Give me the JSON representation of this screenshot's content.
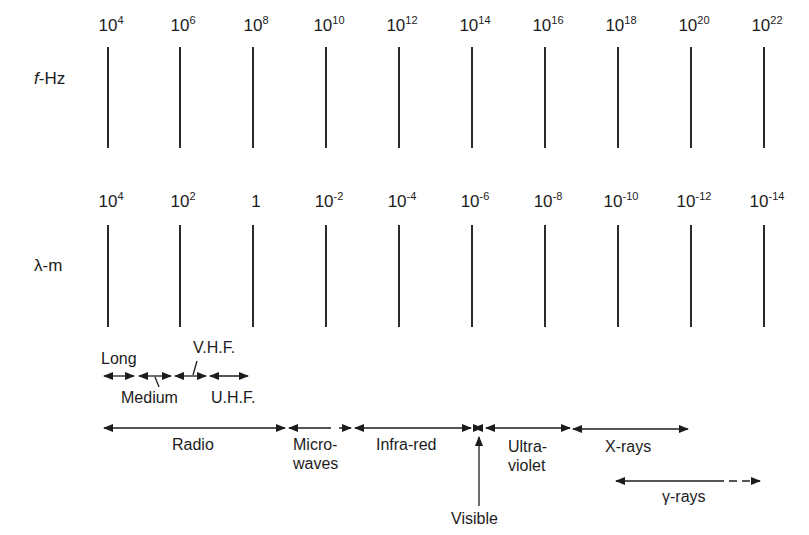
{
  "chart_data": {
    "type": "diagram",
    "axes": [
      {
        "name": "frequency",
        "label": "f-Hz",
        "ticks": [
          {
            "base": "10",
            "exp": "4"
          },
          {
            "base": "10",
            "exp": "6"
          },
          {
            "base": "10",
            "exp": "8"
          },
          {
            "base": "10",
            "exp": "10"
          },
          {
            "base": "10",
            "exp": "12"
          },
          {
            "base": "10",
            "exp": "14"
          },
          {
            "base": "10",
            "exp": "16"
          },
          {
            "base": "10",
            "exp": "18"
          },
          {
            "base": "10",
            "exp": "20"
          },
          {
            "base": "10",
            "exp": "22"
          }
        ]
      },
      {
        "name": "wavelength",
        "label": "λ-m",
        "ticks": [
          {
            "base": "10",
            "exp": "4"
          },
          {
            "base": "10",
            "exp": "2"
          },
          {
            "base": "1",
            "exp": ""
          },
          {
            "base": "10",
            "exp": "-2"
          },
          {
            "base": "10",
            "exp": "-4"
          },
          {
            "base": "10",
            "exp": "-6"
          },
          {
            "base": "10",
            "exp": "-8"
          },
          {
            "base": "10",
            "exp": "-10"
          },
          {
            "base": "10",
            "exp": "-12"
          },
          {
            "base": "10",
            "exp": "-14"
          }
        ]
      }
    ],
    "radio_subbands": [
      {
        "name": "Long",
        "f_from_exp": 4.0,
        "f_to_exp": 4.8
      },
      {
        "name": "Medium",
        "f_from_exp": 4.9,
        "f_to_exp": 5.8
      },
      {
        "name": "V.H.F.",
        "f_from_exp": 5.9,
        "f_to_exp": 6.7
      },
      {
        "name": "U.H.F.",
        "f_from_exp": 6.9,
        "f_to_exp": 7.9
      }
    ],
    "bands": [
      {
        "name": "Radio",
        "f_from_exp": 4.0,
        "f_to_exp": 9.0
      },
      {
        "name": "Micro-waves",
        "f_from_exp": 9.0,
        "f_to_exp": 10.7
      },
      {
        "name": "Infra-red",
        "f_from_exp": 10.9,
        "f_to_exp": 14.0
      },
      {
        "name": "Visible",
        "f_from_exp": 14.0,
        "f_to_exp": 14.3
      },
      {
        "name": "Ultra-violet",
        "f_from_exp": 14.4,
        "f_to_exp": 16.7
      },
      {
        "name": "X-rays",
        "f_from_exp": 16.7,
        "f_to_exp": 19.9
      },
      {
        "name": "γ-rays",
        "f_from_exp": 18.0,
        "f_to_exp": 22.0,
        "open_ended": true
      }
    ]
  },
  "labels": {
    "f_axis": "f-Hz",
    "lambda_axis": "λ-m",
    "long": "Long",
    "medium": "Medium",
    "vhf": "V.H.F.",
    "uhf": "U.H.F.",
    "radio": "Radio",
    "micro_1": "Micro-",
    "micro_2": "waves",
    "infrared": "Infra-red",
    "ultra_1": "Ultra-",
    "ultra_2": "violet",
    "xrays": "X-rays",
    "gamma": "γ-rays",
    "visible": "Visible"
  }
}
